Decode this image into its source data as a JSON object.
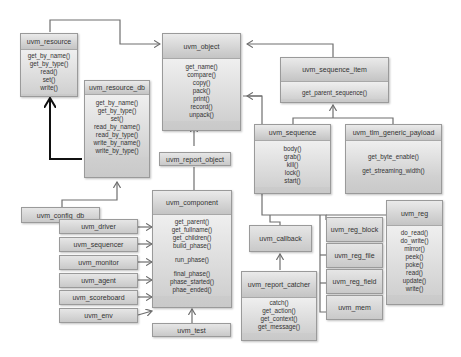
{
  "colors": {
    "box_fill_top": "#e6e6e6",
    "box_fill_bottom": "#c9c9c9",
    "line": "#6f6f6f",
    "bold_line": "#111111",
    "text": "#333333"
  },
  "classes": {
    "uvm_resource": {
      "name": "uvm_resource",
      "methods": [
        "get_by_name()",
        "get_by_type()",
        "read()",
        "set()",
        "write()"
      ]
    },
    "uvm_resource_db": {
      "name": "uvm_resource_db",
      "methods": [
        "get_by_name()",
        "get_by_type()",
        "set()",
        "read_by_name()",
        "read_by_type()",
        "write_by_name()",
        "write_by_type()"
      ]
    },
    "uvm_config_db": {
      "name": "uvm_config_db"
    },
    "uvm_object": {
      "name": "uvm_object",
      "methods": [
        "get_name()",
        "compare()",
        "copy()",
        "pack()",
        "print()",
        "record()",
        "unpack()"
      ]
    },
    "uvm_sequence_item": {
      "name": "uvm_sequence_item",
      "methods": [
        "get_parent_sequence()"
      ]
    },
    "uvm_sequence": {
      "name": "uvm_sequence",
      "methods": [
        "body()",
        "grab()",
        "kill()",
        "lock()",
        "start()"
      ]
    },
    "uvm_tlm_generic_payload": {
      "name": "uvm_tlm_generic_payload",
      "methods": [
        "get_byte_enable()",
        "get_streaming_width()"
      ]
    },
    "uvm_report_object": {
      "name": "uvm_report_object"
    },
    "uvm_component": {
      "name": "uvm_component",
      "methods_group1": [
        "get_parent()",
        "get_fullname()",
        "get_children()",
        "build_phase()"
      ],
      "methods_group2": [
        "run_phase()"
      ],
      "methods_group3": [
        "final_phase()",
        "phase_started()",
        "phae_ended()"
      ]
    },
    "uvm_test": {
      "name": "uvm_test"
    },
    "uvm_driver": {
      "name": "uvm_driver"
    },
    "uvm_sequencer": {
      "name": "uvm_sequencer"
    },
    "uvm_monitor": {
      "name": "uvm_monitor"
    },
    "uvm_agent": {
      "name": "uvm_agent"
    },
    "uvm_scoreboard": {
      "name": "uvm_scoreboard"
    },
    "uvm_env": {
      "name": "uvm_env"
    },
    "uvm_callback": {
      "name": "uvm_callback"
    },
    "uvm_report_catcher": {
      "name": "uvm_report_catcher",
      "methods": [
        "catch()",
        "get_action()",
        "get_context()",
        "get_message()"
      ]
    },
    "uvm_reg_block": {
      "name": "uvm_reg_block"
    },
    "uvm_reg_file": {
      "name": "uvm_reg_file"
    },
    "uvm_reg_field": {
      "name": "uvm_reg_field"
    },
    "uvm_mem": {
      "name": "uvm_mem"
    },
    "uvm_reg": {
      "name": "uvm_reg",
      "methods": [
        "do_read()",
        "do_write()",
        "mirror()",
        "peek()",
        "poke()",
        "read()",
        "update()",
        "write()"
      ]
    }
  }
}
